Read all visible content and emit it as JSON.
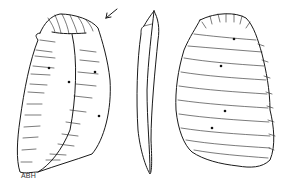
{
  "figure": {
    "views": [
      {
        "name": "dorsal-view",
        "dots": 4,
        "arrow": true
      },
      {
        "name": "profile-view",
        "dots": 0
      },
      {
        "name": "ventral-view",
        "dots": 4
      }
    ],
    "illustrator_initials": "ABH",
    "colors": {
      "line": "#1a1a1a",
      "background": "#ffffff"
    }
  }
}
